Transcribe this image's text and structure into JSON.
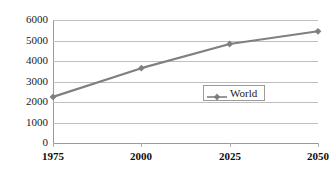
{
  "chart_data": {
    "type": "line",
    "title": "",
    "subtitle": "",
    "xlabel": "",
    "ylabel": "",
    "categories": [
      "1975",
      "2000",
      "2025",
      "2050"
    ],
    "x": [
      1975,
      2000,
      2025,
      2050
    ],
    "series": [
      {
        "name": "World",
        "values": [
          2250,
          3650,
          4830,
          5450
        ],
        "color": "#808080",
        "marker": "diamond"
      }
    ],
    "xlim": [
      1975,
      2050
    ],
    "ylim": [
      0,
      6000
    ],
    "ytick_labels": [
      "0",
      "1000",
      "2000",
      "3000",
      "4000",
      "5000",
      "6000"
    ],
    "ytick_values": [
      0,
      1000,
      2000,
      3000,
      4000,
      5000,
      6000
    ],
    "xtick_labels": [
      "1975",
      "2000",
      "2025",
      "2050"
    ],
    "grid": "horizontal",
    "legend": {
      "entries": [
        "World"
      ],
      "position": "center-right",
      "border": true
    },
    "colors": {
      "series": "#808080",
      "gridline": "#bfbfbf",
      "axis": "#9a9a9a",
      "text": "#1a1a1a",
      "background": "#ffffff"
    }
  }
}
